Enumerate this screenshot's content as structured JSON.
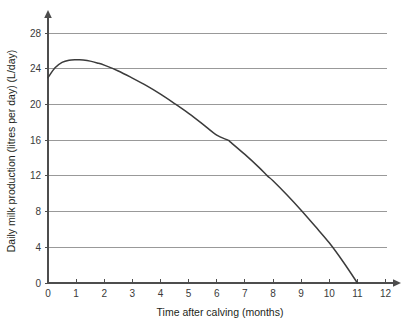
{
  "chart_data": {
    "type": "line",
    "title": "",
    "xlabel": "Time after calving (months)",
    "ylabel": "Daily milk production (litres per day) (L/day)",
    "xlim": [
      0,
      12
    ],
    "ylim": [
      0,
      28
    ],
    "xticks": [
      0,
      1,
      2,
      3,
      4,
      5,
      6,
      7,
      8,
      9,
      10,
      11,
      12
    ],
    "yticks": [
      0,
      4,
      8,
      12,
      16,
      20,
      24,
      28
    ],
    "xtick_labels": [
      "0",
      "1",
      "2",
      "3",
      "4",
      "5",
      "6",
      "7",
      "8",
      "9",
      "10",
      "11",
      "12"
    ],
    "ytick_labels": [
      "0",
      "4",
      "8",
      "12",
      "16",
      "20",
      "24",
      "28"
    ],
    "grid": "horizontal",
    "legend": "none",
    "series": [
      {
        "name": "Daily milk production",
        "color": "#3b3b3b",
        "x": [
          0,
          0.25,
          0.5,
          0.75,
          1,
          1.1,
          1.25,
          1.5,
          1.75,
          2,
          2.5,
          3,
          3.5,
          4,
          4.5,
          5,
          5.5,
          6,
          6.4,
          6.5,
          7,
          7.5,
          7.8,
          8,
          8.5,
          9,
          9.5,
          10,
          10.5,
          11
        ],
        "y": [
          23,
          24.1,
          24.7,
          24.95,
          25,
          25,
          24.97,
          24.85,
          24.65,
          24.4,
          23.75,
          22.95,
          22.1,
          21.15,
          20.1,
          19,
          17.8,
          16.55,
          16,
          15.75,
          14.4,
          12.95,
          12,
          11.45,
          9.85,
          8.15,
          6.35,
          4.5,
          2.35,
          0
        ]
      }
    ],
    "annotations": {
      "start_value": 23,
      "peak_value": 25,
      "peak_time": 1.1,
      "zero_crossing_time": 11
    },
    "axis_arrows": {
      "x_axis": "right-arrow",
      "y_axis": "up-arrow"
    },
    "colors": {
      "curve": "#3b3b3b",
      "gridline": "#8e8e8e",
      "axis": "#4d4d4d",
      "text": "#231f20",
      "background": "#ffffff"
    }
  }
}
